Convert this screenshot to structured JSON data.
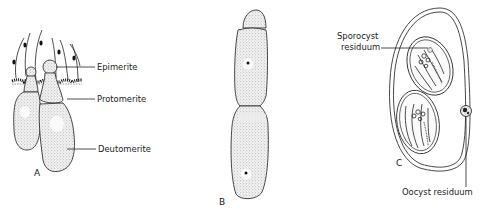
{
  "figure": {
    "panels": [
      {
        "id": "A",
        "letter": "A",
        "labels": {
          "epimerite": "Epimerite",
          "protomerite": "Protomerite",
          "deutomerite": "Deutomerite"
        }
      },
      {
        "id": "B",
        "letter": "B"
      },
      {
        "id": "C",
        "letter": "C",
        "labels": {
          "sporocyst_residuum_line1": "Sporocyst",
          "sporocyst_residuum_line2": "residuum",
          "oocyst_residuum": "Oocyst residuum"
        }
      }
    ],
    "colors": {
      "ink": "#222222",
      "stipple": "#d9d9d9",
      "background": "#ffffff"
    }
  }
}
